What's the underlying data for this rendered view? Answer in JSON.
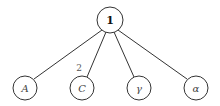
{
  "diagram": {
    "type": "tree",
    "root": {
      "label": "1",
      "cx": 110,
      "cy": 20,
      "r": 13
    },
    "children": [
      {
        "label": "A",
        "cx": 25,
        "cy": 88,
        "r": 12
      },
      {
        "label": "C",
        "cx": 82,
        "cy": 88,
        "r": 12
      },
      {
        "label": "γ",
        "cx": 139,
        "cy": 88,
        "r": 12
      },
      {
        "label": "α",
        "cx": 196,
        "cy": 88,
        "r": 12
      }
    ],
    "edge_labels": [
      {
        "label": "2",
        "x": 78,
        "y": 72
      }
    ]
  }
}
